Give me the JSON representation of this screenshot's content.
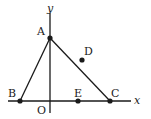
{
  "diagram": {
    "type": "coordinate-geometry",
    "axes": {
      "x_label": "x",
      "y_label": "y",
      "origin_label": "O"
    },
    "points": [
      {
        "id": "A",
        "label": "A",
        "x": 50,
        "y": 38
      },
      {
        "id": "B",
        "label": "B",
        "x": 20,
        "y": 101
      },
      {
        "id": "C",
        "label": "C",
        "x": 110,
        "y": 101
      },
      {
        "id": "D",
        "label": "D",
        "x": 82,
        "y": 60
      },
      {
        "id": "E",
        "label": "E",
        "x": 78,
        "y": 101
      }
    ],
    "segments": [
      [
        "A",
        "B"
      ],
      [
        "A",
        "C"
      ],
      [
        "B",
        "C"
      ]
    ]
  }
}
